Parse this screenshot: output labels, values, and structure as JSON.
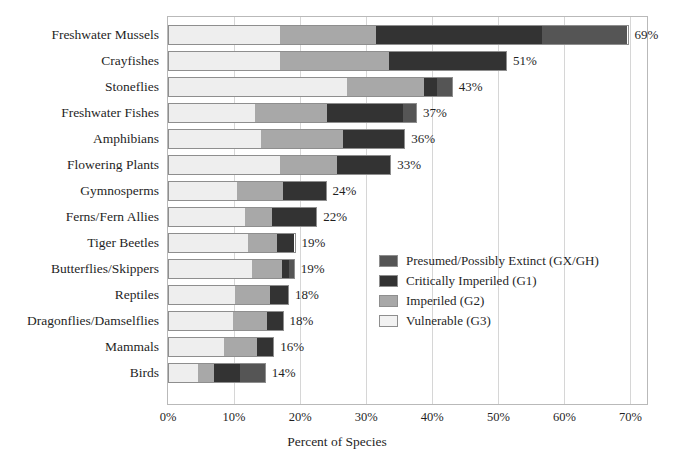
{
  "chart_data": {
    "type": "bar",
    "subtype": "stacked-horizontal",
    "title": "",
    "xlabel": "Percent of Species",
    "ylabel": "",
    "xlim": [
      0,
      72.5
    ],
    "xticks": [
      0,
      10,
      20,
      30,
      40,
      50,
      60,
      70
    ],
    "xtick_labels": [
      "0%",
      "10%",
      "20%",
      "30%",
      "40%",
      "50%",
      "60%",
      "70%"
    ],
    "grid": "vertical",
    "legend_position": "inside-right-middle",
    "categories": [
      "Freshwater Mussels",
      "Crayfishes",
      "Stoneflies",
      "Freshwater Fishes",
      "Amphibians",
      "Flowering Plants",
      "Gymnosperms",
      "Ferns/Fern Allies",
      "Tiger Beetles",
      "Butterflies/Skippers",
      "Reptiles",
      "Dragonflies/Damselflies",
      "Mammals",
      "Birds"
    ],
    "series": [
      {
        "name": "Vulnerable (G3)",
        "color": "#eeeeee",
        "values": [
          16.9,
          16.9,
          27.1,
          13.1,
          14.0,
          16.9,
          10.4,
          11.6,
          12.2,
          12.7,
          10.2,
          9.8,
          8.5,
          4.5
        ]
      },
      {
        "name": "Imperiled (G2)",
        "color": "#a8a8a8",
        "values": [
          14.5,
          16.6,
          11.7,
          11.0,
          12.5,
          8.7,
          7.1,
          4.2,
          4.4,
          4.7,
          5.4,
          5.3,
          5.1,
          2.4
        ]
      },
      {
        "name": "Critically Imperiled (G1)",
        "color": "#333333",
        "values": [
          25.3,
          17.8,
          2.1,
          11.6,
          9.4,
          8.2,
          6.5,
          6.8,
          2.7,
          1.0,
          2.7,
          2.4,
          2.5,
          4.1
        ]
      },
      {
        "name": "Presumed/Possibly Extinct (GX/GH)",
        "color": "#555555",
        "values": [
          13.0,
          0.0,
          2.2,
          2.0,
          0.0,
          0.0,
          0.0,
          0.0,
          0.0,
          0.8,
          0.0,
          0.0,
          0.0,
          3.8
        ]
      }
    ],
    "totals": [
      69.7,
      51.3,
      43.1,
      37.7,
      35.9,
      33.8,
      24.0,
      22.6,
      19.3,
      19.2,
      18.3,
      17.5,
      16.1,
      14.8
    ],
    "value_labels": [
      "69%",
      "51%",
      "43%",
      "37%",
      "36%",
      "33%",
      "24%",
      "22%",
      "19%",
      "19%",
      "18%",
      "18%",
      "16%",
      "14%"
    ]
  },
  "legend": {
    "items": [
      {
        "label": "Presumed/Possibly Extinct (GX/GH)",
        "color": "#555555"
      },
      {
        "label": "Critically Imperiled (G1)",
        "color": "#333333"
      },
      {
        "label": "Imperiled (G2)",
        "color": "#a8a8a8"
      },
      {
        "label": "Vulnerable (G3)",
        "color": "#f2f2f2"
      }
    ]
  },
  "colors": {
    "grid": "#d6d6d6",
    "frame": "#b9b9b9",
    "bar_outline": "#8e8e8e",
    "text": "#1f1f1f",
    "background": "#ffffff"
  }
}
